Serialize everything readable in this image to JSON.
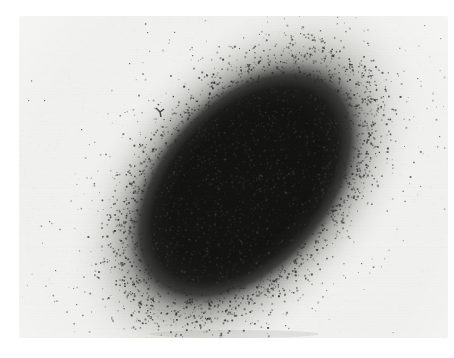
{
  "page": {
    "width": 454,
    "height": 358,
    "background_color": "#ffffff"
  },
  "photo": {
    "x": 19,
    "y": 16,
    "width": 429,
    "height": 322,
    "base_color": "#f0f0ee",
    "edge_white": "#fbfbfa"
  },
  "core": {
    "cx": 226,
    "cy": 169,
    "rx": 113,
    "ry": 71,
    "rotation_deg": -48,
    "dark_color": "#131312",
    "mid_color": "#1c1c1b",
    "fade_color": "#969692",
    "halo_outer_scale": 1.9,
    "grain_texture_count": 1300
  },
  "speckle_ring": {
    "count": 1750,
    "mean_t": 1.3,
    "sd_t": 0.16,
    "min_t": 0.98,
    "max_t": 1.78,
    "dot_size_min": 0.7,
    "dot_size_max": 2.0,
    "cluster_chance": 0.15,
    "color": "#2d2d2b"
  },
  "outer_sprinkle": {
    "count": 240,
    "min_t": 1.55,
    "max_t": 2.25,
    "color": "#3b3b39"
  },
  "background_specks": {
    "count": 62,
    "size_min": 0.7,
    "size_max": 1.6,
    "color": "#454543",
    "fixed_points": [
      [
        9,
        84
      ],
      [
        25,
        84
      ],
      [
        62,
        113
      ],
      [
        246,
        96
      ],
      [
        110,
        47
      ],
      [
        173,
        39
      ],
      [
        281,
        17
      ],
      [
        266,
        309
      ],
      [
        203,
        295
      ],
      [
        36,
        254
      ],
      [
        30,
        205
      ],
      [
        128,
        16
      ],
      [
        421,
        22
      ],
      [
        405,
        9
      ],
      [
        398,
        62
      ],
      [
        57,
        288
      ],
      [
        342,
        247
      ],
      [
        420,
        120
      ]
    ]
  },
  "blemish": {
    "x": 141,
    "y": 96,
    "color": "#242422"
  },
  "film_grain": {
    "count": 2800,
    "max_alpha": 0.07
  },
  "scanline_alpha": 0.012,
  "bottom_smudge": {
    "x": 215,
    "y": 318,
    "rx": 85,
    "ry": 4,
    "color": "#8a8a86"
  },
  "seed": 1337
}
